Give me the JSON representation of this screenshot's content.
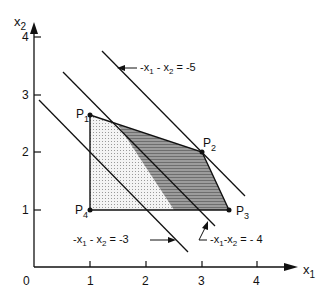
{
  "axes": {
    "x_label": "x",
    "x_sub": "1",
    "y_label": "x",
    "y_sub": "2",
    "origin_label": "0",
    "x_ticks": [
      "1",
      "2",
      "3",
      "4"
    ],
    "y_ticks": [
      "1",
      "2",
      "3",
      "4"
    ]
  },
  "points": [
    {
      "name": "P",
      "sub": "1",
      "x": 1,
      "y": 2.67
    },
    {
      "name": "P",
      "sub": "2",
      "x": 3,
      "y": 2
    },
    {
      "name": "P",
      "sub": "3",
      "x": 3.5,
      "y": 1
    },
    {
      "name": "P",
      "sub": "4",
      "x": 1,
      "y": 1
    }
  ],
  "lines": [
    {
      "id": "line3",
      "equation_lhs": "-x",
      "rhs": "-3",
      "value": 3
    },
    {
      "id": "line4",
      "equation_lhs": "-x",
      "rhs": "-4",
      "value": 4
    },
    {
      "id": "line5",
      "equation_lhs": "-x",
      "rhs": "-5",
      "value": 5
    }
  ],
  "labels": {
    "line3": {
      "a": "-x",
      "a_sub": "1",
      "b": " - x",
      "b_sub": "2",
      "eq": " = -3"
    },
    "line4": {
      "a": "-x",
      "a_sub": "1",
      "b": "-x",
      "b_sub": "2",
      "eq": " = - 4"
    },
    "line5": {
      "a": "-x",
      "a_sub": "1",
      "b": " - x",
      "b_sub": "2",
      "eq": " = -5"
    }
  },
  "colors": {
    "ink": "#111111",
    "light_fill": "#e2e2e2",
    "dark_fill": "#8a8a8a"
  }
}
